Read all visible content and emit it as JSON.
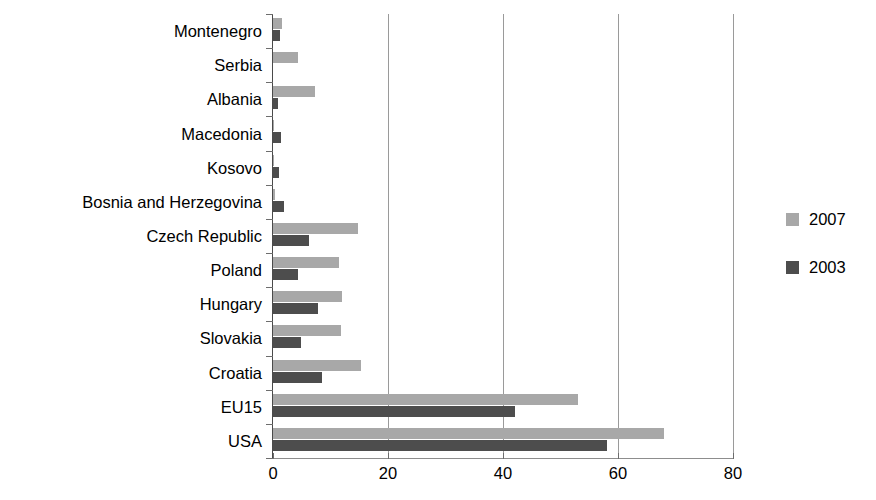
{
  "chart_data": {
    "type": "bar",
    "orientation": "horizontal",
    "title": "",
    "xlabel": "",
    "ylabel": "",
    "xlim": [
      0,
      80
    ],
    "xticks": [
      0,
      20,
      40,
      60,
      80
    ],
    "xtick_labels": [
      "0",
      "20",
      "40",
      "60",
      "80"
    ],
    "grid": true,
    "grid_axis": "x",
    "legend_position": "right",
    "categories": [
      "Montenegro",
      "Serbia",
      "Albania",
      "Macedonia",
      "Kosovo",
      "Bosnia and Herzegovina",
      "Czech Republic",
      "Poland",
      "Hungary",
      "Slovakia",
      "Croatia",
      "EU15",
      "USA"
    ],
    "series": [
      {
        "name": "2007",
        "color": "#a8a8a8",
        "values": [
          1.6,
          4.3,
          7.3,
          0.2,
          0.2,
          0.3,
          14.8,
          11.5,
          12.0,
          11.8,
          15.3,
          53.0,
          68.0
        ]
      },
      {
        "name": "2003",
        "color": "#4d4d4d",
        "values": [
          1.2,
          0.0,
          0.8,
          1.4,
          1.1,
          1.9,
          6.2,
          4.4,
          7.8,
          4.9,
          8.5,
          42.0,
          58.0
        ]
      }
    ]
  },
  "legend": {
    "items": [
      {
        "label": "2007",
        "color": "#a8a8a8"
      },
      {
        "label": "2003",
        "color": "#4d4d4d"
      }
    ]
  }
}
